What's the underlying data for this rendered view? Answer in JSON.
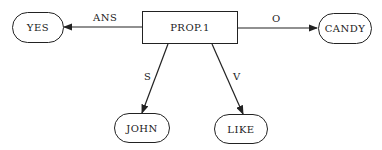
{
  "diagram": {
    "center": {
      "label": "PROP.1"
    },
    "nodes": {
      "yes": {
        "label": "YES"
      },
      "candy": {
        "label": "CANDY"
      },
      "john": {
        "label": "JOHN"
      },
      "like": {
        "label": "LIKE"
      }
    },
    "edges": [
      {
        "from": "PROP.1",
        "to": "YES",
        "label": "ANS"
      },
      {
        "from": "PROP.1",
        "to": "CANDY",
        "label": "O"
      },
      {
        "from": "PROP.1",
        "to": "JOHN",
        "label": "S"
      },
      {
        "from": "PROP.1",
        "to": "LIKE",
        "label": "V"
      }
    ]
  }
}
